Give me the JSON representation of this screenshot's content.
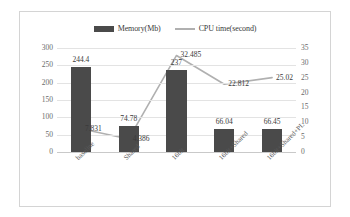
{
  "chart_data": {
    "type": "bar",
    "title": "",
    "xlabel": "",
    "ylabel": "",
    "grid": true,
    "legend_position": "top-center",
    "categories": [
      "baseline",
      "Shared",
      "16bit",
      "16bit+Shared",
      "16bit+Shared+PL"
    ],
    "series": [
      {
        "name": "Memory(Mb)",
        "type": "bar",
        "axis": "left",
        "color": "#4a4a4a",
        "values": [
          244.4,
          74.78,
          237,
          66.04,
          66.45
        ],
        "labels": [
          "244.4",
          "74.78",
          "237",
          "66.04",
          "66.45"
        ]
      },
      {
        "name": "CPU time(second)",
        "type": "line",
        "axis": "right",
        "color": "#b0b0b0",
        "values": [
          7.831,
          4.386,
          32.485,
          22.812,
          25.02
        ],
        "labels": [
          "7.831",
          "4.386",
          "32.485",
          "22.812",
          "25.02"
        ]
      }
    ],
    "left_axis": {
      "label": "",
      "ylim": [
        0,
        300
      ],
      "ticks": [
        300,
        250,
        200,
        150,
        100,
        50,
        0
      ],
      "tick_labels": [
        "300",
        "250",
        "200",
        "150",
        "100",
        "50",
        "0"
      ]
    },
    "right_axis": {
      "label": "",
      "ylim": [
        0,
        35
      ],
      "ticks": [
        35,
        30,
        25,
        20,
        15,
        10,
        5,
        0
      ],
      "tick_labels": [
        "35",
        "30",
        "25",
        "20",
        "15",
        "10",
        "5",
        "0"
      ]
    }
  },
  "legend": {
    "entries": [
      {
        "label": "Memory(Mb)",
        "marker": "bar-swatch-icon"
      },
      {
        "label": "CPU time(second)",
        "marker": "line-swatch-icon"
      }
    ]
  }
}
